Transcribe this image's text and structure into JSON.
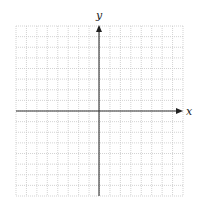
{
  "diagram": {
    "type": "coordinate-grid",
    "title": "",
    "axes": {
      "x": {
        "label": "x",
        "has_arrow": true
      },
      "y": {
        "label": "y",
        "has_arrow": true
      }
    },
    "grid": {
      "columns": 16,
      "rows": 16,
      "line_style": "dotted",
      "line_color": "#c8c8c8",
      "axis_color": "#333333"
    },
    "geometry": {
      "left": 16,
      "top": 26,
      "right": 183,
      "bottom": 196,
      "origin_x": 99,
      "origin_y": 111
    }
  }
}
